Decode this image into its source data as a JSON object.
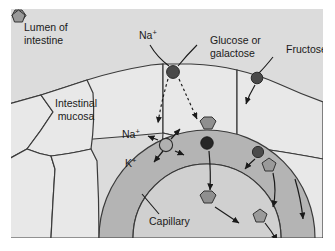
{
  "figure": {
    "background_color": "#ffffff",
    "panel_color": "#dcdcdc"
  },
  "labels": {
    "lumen": "Lumen of\nintestine",
    "lumen_line1": "Lumen of",
    "lumen_line2": "intestine",
    "mucosa_line1": "Intestinal",
    "mucosa_line2": "mucosa",
    "capillary": "Capillary",
    "na_apical": "Na",
    "na_apical_charge": "+",
    "na_pump": "Na",
    "na_pump_charge": "+",
    "k_pump": "K",
    "k_pump_charge": "+"
  },
  "legend": {
    "glucose": {
      "label_line1": "Glucose or",
      "label_line2": "galactose",
      "icon": "hexagon-icon",
      "fill": "#8f8f8f",
      "stroke": "#333333"
    },
    "fructose": {
      "label": "Fructose",
      "icon": "pentagon-icon",
      "fill": "#9a9a9a",
      "stroke": "#333333"
    }
  },
  "colors": {
    "panel_background": "#dcdcdc",
    "cell_fill": "#e8e8e8",
    "cell_stroke": "#3a3a3a",
    "capillary_wall": "#b4b4b4",
    "capillary_lumen": "#d0d0d0",
    "transporter_dark": "#4a4a4a",
    "transporter_light": "#b0b0b0",
    "arrow": "#1a1a1a",
    "text": "#1a1a1a"
  },
  "transporters": [
    {
      "name": "sglt1-apical-cotransporter",
      "type": "dark-circle",
      "x": 162,
      "y": 63
    },
    {
      "name": "glut5-apical-transporter",
      "type": "dark-circle",
      "x": 246,
      "y": 69
    },
    {
      "name": "na-k-atpase-pump",
      "type": "light-circle",
      "x": 155,
      "y": 136
    },
    {
      "name": "glut2-basolateral-transporter",
      "type": "dark-circle",
      "x": 196,
      "y": 134
    },
    {
      "name": "glut5-basolateral-transporter",
      "type": "dark-circle",
      "x": 247,
      "y": 143
    }
  ],
  "molecules": [
    {
      "name": "glucose-molecule-apical",
      "shape": "hexagon",
      "x": 196,
      "y": 116
    },
    {
      "name": "fructose-molecule-apical",
      "shape": "pentagon",
      "x": 258,
      "y": 155
    },
    {
      "name": "glucose-molecule-capillary",
      "shape": "hexagon",
      "x": 196,
      "y": 190
    },
    {
      "name": "fructose-molecule-capillary",
      "shape": "pentagon",
      "x": 249,
      "y": 206
    }
  ]
}
